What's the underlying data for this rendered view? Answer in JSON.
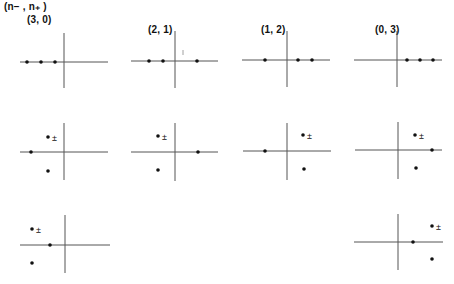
{
  "header_label": "(n− , n₊ )",
  "panels": [
    {
      "id": "3-0",
      "title": "(3, 0)",
      "ox": 64,
      "oy": 62,
      "xmin": 20,
      "xmax": 108,
      "ymin": 33,
      "ymax": 88,
      "dots": [
        [
          27,
          62
        ],
        [
          41,
          62
        ],
        [
          55,
          62
        ]
      ],
      "pm": [],
      "tick": null
    },
    {
      "id": "2-1",
      "title": "(2, 1)",
      "ox": 175,
      "oy": 61,
      "xmin": 131,
      "xmax": 218,
      "ymin": 31,
      "ymax": 88,
      "dots": [
        [
          149,
          61
        ],
        [
          163,
          61
        ],
        [
          197,
          61
        ]
      ],
      "pm": [],
      "tick": [
        183,
        53
      ]
    },
    {
      "id": "1-2",
      "title": "(1, 2)",
      "ox": 287,
      "oy": 60,
      "xmin": 242,
      "xmax": 330,
      "ymin": 31,
      "ymax": 87,
      "dots": [
        [
          265,
          60
        ],
        [
          298,
          60
        ],
        [
          312,
          60
        ]
      ],
      "pm": [],
      "tick": null
    },
    {
      "id": "0-3",
      "title": "(0, 3)",
      "ox": 397,
      "oy": 60,
      "xmin": 354,
      "xmax": 442,
      "ymin": 31,
      "ymax": 87,
      "dots": [
        [
          407,
          60
        ],
        [
          420,
          60
        ],
        [
          433,
          60
        ]
      ],
      "pm": [],
      "tick": null
    },
    {
      "id": "r2-1",
      "ox": 64,
      "oy": 152,
      "xmin": 20,
      "xmax": 108,
      "ymin": 123,
      "ymax": 180,
      "dots": [
        [
          31,
          152
        ],
        [
          48,
          137
        ],
        [
          48,
          171
        ]
      ],
      "pm": [
        [
          48,
          137
        ]
      ],
      "tick": null
    },
    {
      "id": "r2-2",
      "ox": 175,
      "oy": 152,
      "xmin": 131,
      "xmax": 218,
      "ymin": 123,
      "ymax": 181,
      "dots": [
        [
          198,
          152
        ],
        [
          158,
          136
        ],
        [
          158,
          170
        ]
      ],
      "pm": [
        [
          158,
          136
        ]
      ],
      "tick": null
    },
    {
      "id": "r2-3",
      "ox": 287,
      "oy": 151,
      "xmin": 243,
      "xmax": 331,
      "ymin": 123,
      "ymax": 180,
      "dots": [
        [
          265,
          151
        ],
        [
          303,
          135
        ],
        [
          304,
          169
        ]
      ],
      "pm": [
        [
          303,
          135
        ]
      ],
      "tick": null
    },
    {
      "id": "r2-4",
      "ox": 398,
      "oy": 150,
      "xmin": 355,
      "xmax": 442,
      "ymin": 122,
      "ymax": 179,
      "dots": [
        [
          432,
          150
        ],
        [
          415,
          135
        ],
        [
          416,
          168
        ]
      ],
      "pm": [
        [
          415,
          135
        ]
      ],
      "tick": null
    },
    {
      "id": "r3-1",
      "ox": 65,
      "oy": 245,
      "xmin": 20,
      "xmax": 110,
      "ymin": 215,
      "ymax": 273,
      "dots": [
        [
          50,
          245
        ],
        [
          32,
          229
        ],
        [
          32,
          263
        ]
      ],
      "pm": [
        [
          32,
          229
        ]
      ],
      "tick": null
    },
    {
      "id": "r3-4",
      "ox": 398,
      "oy": 242,
      "xmin": 354,
      "xmax": 443,
      "ymin": 214,
      "ymax": 270,
      "dots": [
        [
          413,
          242
        ],
        [
          432,
          226
        ],
        [
          432,
          259
        ]
      ],
      "pm": [
        [
          432,
          226
        ]
      ],
      "tick": null
    }
  ],
  "pm_symbol": "±",
  "colors": {
    "line": "#555555",
    "dot": "#111111",
    "text": "#111111"
  }
}
